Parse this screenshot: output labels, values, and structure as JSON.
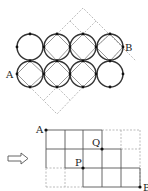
{
  "diagram": {
    "top": {
      "labels": {
        "A": "A",
        "B": "B"
      },
      "circles": {
        "rows": 2,
        "cols": 4,
        "centers_x": [
          30,
          57,
          83,
          110
        ],
        "centers_y": [
          47,
          74
        ],
        "radius": 13
      },
      "colors": {
        "circle": "#333333",
        "square": "#999999",
        "dash": "#aaaaaa",
        "dot": "#111111"
      }
    },
    "arrow": {
      "symbol": "⇨"
    },
    "bottom": {
      "labels": {
        "A": "A",
        "P": "P",
        "Q": "Q",
        "B": "B"
      },
      "grid": {
        "xs": [
          46,
          65,
          83,
          102,
          121,
          140
        ],
        "ys": [
          130,
          149,
          168,
          187
        ]
      },
      "points": {
        "A": [
          46,
          130
        ],
        "Q": [
          102,
          149
        ],
        "P": [
          83,
          168
        ],
        "B": [
          140,
          187
        ]
      }
    }
  }
}
